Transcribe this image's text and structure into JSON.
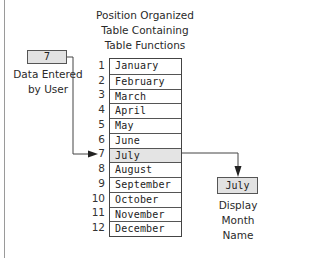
{
  "title": {
    "lines": [
      "Position Organized",
      "Table Containing",
      "Table Functions"
    ]
  },
  "input": {
    "value": "7",
    "label_lines": [
      "Data Entered",
      "by User"
    ]
  },
  "table": {
    "rows": [
      {
        "index": "1",
        "value": "January"
      },
      {
        "index": "2",
        "value": "February"
      },
      {
        "index": "3",
        "value": "March"
      },
      {
        "index": "4",
        "value": "April"
      },
      {
        "index": "5",
        "value": "May"
      },
      {
        "index": "6",
        "value": "June"
      },
      {
        "index": "7",
        "value": "July",
        "selected": true
      },
      {
        "index": "8",
        "value": "August"
      },
      {
        "index": "9",
        "value": "September"
      },
      {
        "index": "10",
        "value": "October"
      },
      {
        "index": "11",
        "value": "November"
      },
      {
        "index": "12",
        "value": "December"
      }
    ]
  },
  "output": {
    "value": "July",
    "label_lines": [
      "Display",
      "Month Name"
    ]
  },
  "colors": {
    "box_fill": "#e2e2e2",
    "selected_row": "#e4e4e4",
    "line": "#444444"
  }
}
